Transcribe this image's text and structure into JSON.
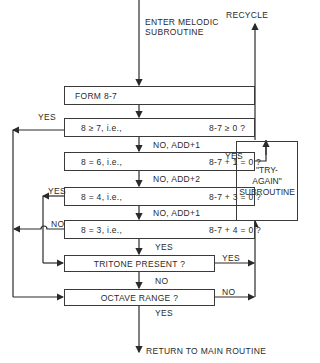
{
  "entry": {
    "line1": "ENTER MELODIC",
    "line2": "SUBROUTINE"
  },
  "recycle": "RECYCLE",
  "form_box": "FORM 8-7",
  "conditions": [
    {
      "left": "8 ≥ 7, i.e.,",
      "right": "8-7 ≥ 0 ?",
      "yes_label": "YES",
      "next_label": "NO, ADD+1"
    },
    {
      "left": "8 = 6, i.e.,",
      "right": "8-7 + 1 = 0 ?",
      "yes_label": "YES",
      "next_label": "NO, ADD+2"
    },
    {
      "left": "8 = 4, i.e.,",
      "right": "8-7 + 3 = 0 ?",
      "yes_label": "YES",
      "next_label": "NO, ADD+1"
    },
    {
      "left": "8 = 3, i.e.,",
      "right": "8-7 + 4 = 0 ?",
      "no_label": "NO",
      "next_label": "YES"
    }
  ],
  "tritone": {
    "label": "TRITONE PRESENT ?",
    "yes_label": "YES",
    "no_label": "NO"
  },
  "octave": {
    "label": "OCTAVE  RANGE ?",
    "no_label": "NO",
    "yes_label": "YES"
  },
  "try_again": {
    "line1": "\"TRY-",
    "line2": "AGAIN\"",
    "line3": "SUBROUTINE"
  },
  "exit": "RETURN TO MAIN ROUTINE"
}
